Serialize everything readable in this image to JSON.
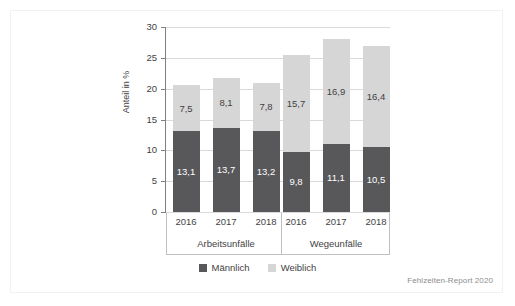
{
  "chart_data": {
    "type": "bar",
    "subtype": "stacked",
    "title": "",
    "xlabel": "",
    "ylabel": "Anteil in %",
    "ylim": [
      0,
      30
    ],
    "yticks": [
      0,
      5,
      10,
      15,
      20,
      25,
      30
    ],
    "ytick_labels": [
      "0",
      "5",
      "10",
      "15",
      "20",
      "25",
      "30"
    ],
    "grid": true,
    "grid_axis": "y",
    "legend_position": "bottom-center",
    "groups": [
      {
        "name": "Arbeitsunfälle",
        "categories": [
          "2016",
          "2017",
          "2018"
        ]
      },
      {
        "name": "Wegeunfälle",
        "categories": [
          "2016",
          "2017",
          "2018"
        ]
      }
    ],
    "categories": [
      "2016",
      "2017",
      "2018",
      "2016",
      "2017",
      "2018"
    ],
    "series": [
      {
        "name": "Männlich",
        "color": "#58585a",
        "values": [
          13.1,
          13.7,
          13.2,
          9.8,
          11.1,
          10.5
        ],
        "labels": [
          "13,1",
          "13,7",
          "13,2",
          "9,8",
          "11,1",
          "10,5"
        ]
      },
      {
        "name": "Weiblich",
        "color": "#d6d6d6",
        "values": [
          7.5,
          8.1,
          7.8,
          15.7,
          16.9,
          16.4
        ],
        "labels": [
          "7,5",
          "8,1",
          "7,8",
          "15,7",
          "16,9",
          "16,4"
        ]
      }
    ],
    "totals": [
      20.6,
      21.8,
      21.0,
      25.5,
      28.0,
      26.9
    ],
    "source_note": "Fehlzeiten-Report 2020"
  },
  "legend": {
    "items": [
      {
        "label": "Männlich",
        "color": "#58585a"
      },
      {
        "label": "Weiblich",
        "color": "#d6d6d6"
      }
    ]
  },
  "source": {
    "text": "Fehlzeiten-Report 2020"
  }
}
